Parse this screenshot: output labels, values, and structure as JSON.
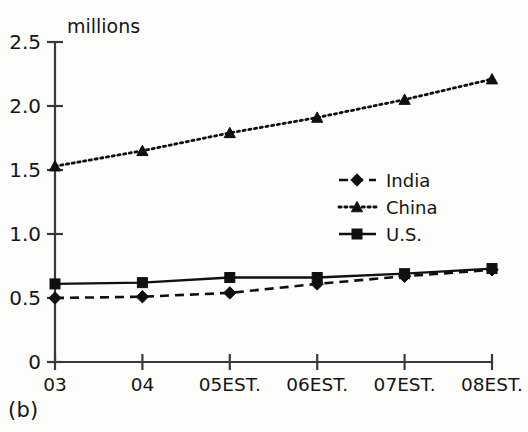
{
  "caption": "(b)",
  "chart_data": {
    "type": "line",
    "title": "",
    "ylabel_inline": "millions",
    "xlabel": "",
    "categories": [
      "03",
      "04",
      "05EST.",
      "06EST.",
      "07EST.",
      "08EST."
    ],
    "ylim": [
      0,
      2.5
    ],
    "yticks": [
      0,
      0.5,
      1.0,
      1.5,
      2.0,
      2.5
    ],
    "ytick_labels": [
      "0",
      "0.5",
      "1.0",
      "1.5",
      "2.0",
      "2.5"
    ],
    "grid": false,
    "legend_position": "center-right",
    "series": [
      {
        "name": "India",
        "marker": "diamond",
        "line_style": "dashed",
        "values": [
          0.5,
          0.51,
          0.54,
          0.61,
          0.67,
          0.72
        ]
      },
      {
        "name": "China",
        "marker": "triangle",
        "line_style": "dotted",
        "values": [
          1.53,
          1.65,
          1.79,
          1.91,
          2.05,
          2.21
        ]
      },
      {
        "name": "U.S.",
        "marker": "square",
        "line_style": "solid",
        "values": [
          0.61,
          0.62,
          0.66,
          0.66,
          0.69,
          0.73
        ]
      }
    ],
    "colors": {
      "ink": "#101010",
      "axis": "#3a3a38",
      "background": "#fdfdfc"
    }
  }
}
